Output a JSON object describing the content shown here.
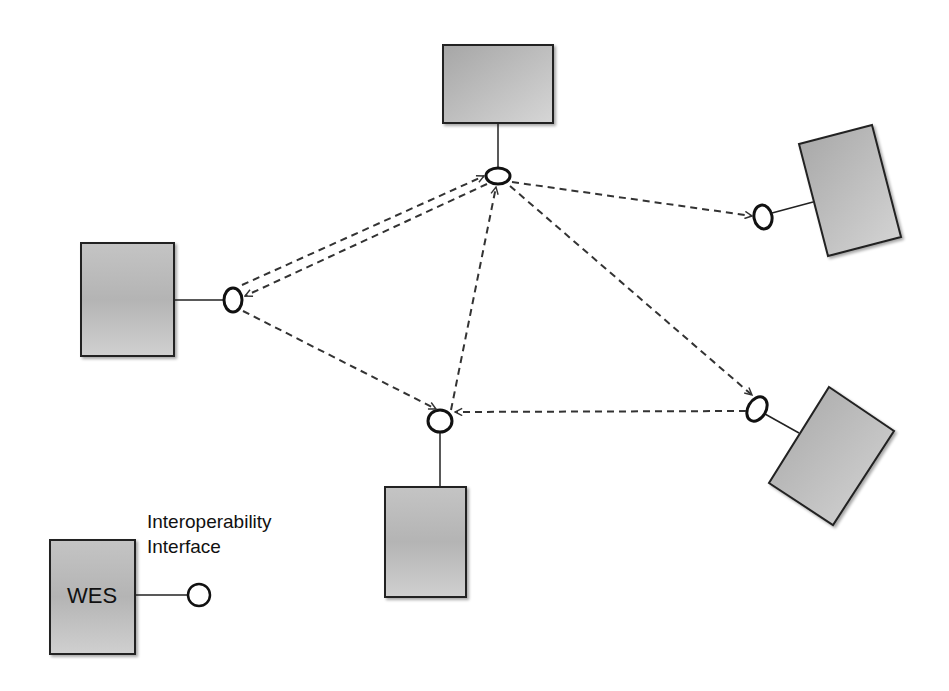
{
  "diagram": {
    "colors": {
      "box_fill_light": "#d2d2d2",
      "box_fill_dark": "#a8a8a8",
      "stroke": "#222222",
      "dashed": "#333333",
      "background": "#ffffff"
    },
    "nodes": [
      {
        "id": "wes-top",
        "label": "",
        "x": 443,
        "y": 45,
        "w": 110,
        "h": 78,
        "rotation": 0,
        "interface": {
          "cx": 498,
          "cy": 176
        }
      },
      {
        "id": "wes-left",
        "label": "",
        "x": 81,
        "y": 243,
        "w": 93,
        "h": 113,
        "rotation": 0,
        "interface": {
          "cx": 233,
          "cy": 300
        }
      },
      {
        "id": "wes-right-top",
        "label": "",
        "rotation": -15,
        "interface": {
          "cx": 763,
          "cy": 217
        }
      },
      {
        "id": "wes-right-bottom",
        "label": "",
        "rotation": 33,
        "interface": {
          "cx": 757,
          "cy": 409
        }
      },
      {
        "id": "wes-bottom",
        "label": "",
        "x": 385,
        "y": 487,
        "w": 81,
        "h": 110,
        "rotation": 0,
        "interface": {
          "cx": 440,
          "cy": 421
        }
      }
    ],
    "connections": [
      {
        "from": "wes-left",
        "to": "wes-top",
        "style": "dashed",
        "arrow": "to"
      },
      {
        "from": "wes-top",
        "to": "wes-left",
        "style": "dashed",
        "arrow": "to"
      },
      {
        "from": "wes-top",
        "to": "wes-right-top",
        "style": "dashed",
        "arrow": "to"
      },
      {
        "from": "wes-top",
        "to": "wes-right-bottom",
        "style": "dashed",
        "arrow": "to"
      },
      {
        "from": "wes-bottom",
        "to": "wes-top",
        "style": "dashed",
        "arrow": "to"
      },
      {
        "from": "wes-left",
        "to": "wes-bottom",
        "style": "dashed",
        "arrow": "to"
      },
      {
        "from": "wes-right-bottom",
        "to": "wes-bottom",
        "style": "dashed",
        "arrow": "to"
      }
    ],
    "legend": {
      "box_label": "WES",
      "interface_label_line1": "Interoperability",
      "interface_label_line2": "Interface"
    }
  }
}
